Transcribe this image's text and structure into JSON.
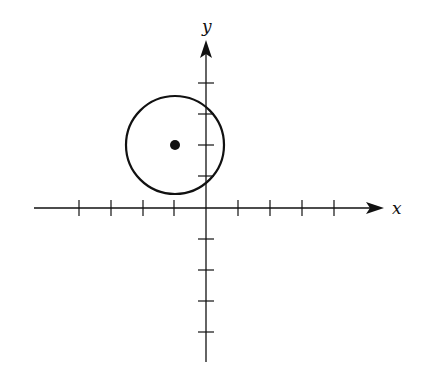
{
  "diagram": {
    "type": "coordinate-plane-circle",
    "axes": {
      "x_label": "x",
      "y_label": "y",
      "x_ticks": [
        -4,
        -3,
        -2,
        -1,
        1,
        2,
        3,
        4
      ],
      "y_ticks": [
        -4,
        -3,
        -2,
        -1,
        1,
        2,
        3,
        4
      ]
    },
    "circle": {
      "center": [
        -1,
        2
      ],
      "radius": 1.6
    },
    "center_point": [
      -1,
      2
    ],
    "colors": {
      "stroke": "#111111",
      "background": "#ffffff"
    }
  }
}
